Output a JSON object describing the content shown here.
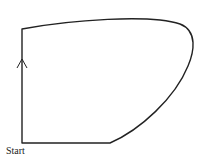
{
  "diagram": {
    "type": "closed-path",
    "start_label": "Start",
    "direction_arrow": "up",
    "stroke_color": "#222222",
    "background_color": "#ffffff",
    "segments": [
      {
        "name": "left-edge",
        "kind": "straight",
        "from": [
          22,
          143
        ],
        "to": [
          22,
          29
        ]
      },
      {
        "name": "top-curve",
        "kind": "curve",
        "from": [
          22,
          29
        ],
        "to": [
          192,
          48
        ]
      },
      {
        "name": "right-curve",
        "kind": "curve",
        "from": [
          192,
          48
        ],
        "to": [
          110,
          143
        ]
      },
      {
        "name": "bottom-edge",
        "kind": "straight",
        "from": [
          110,
          143
        ],
        "to": [
          22,
          143
        ]
      }
    ]
  }
}
